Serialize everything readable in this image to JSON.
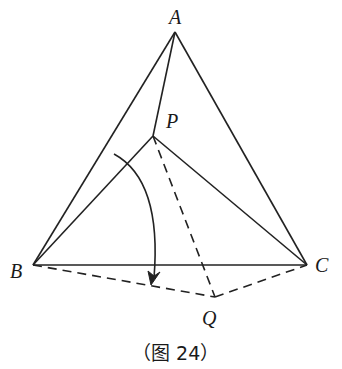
{
  "figure": {
    "caption": "（图 24）",
    "points": {
      "A": {
        "label": "A",
        "x": 175,
        "y": 32
      },
      "P": {
        "label": "P",
        "x": 153,
        "y": 136
      },
      "B": {
        "label": "B",
        "x": 33,
        "y": 265
      },
      "C": {
        "label": "C",
        "x": 307,
        "y": 265
      },
      "Q": {
        "label": "Q",
        "x": 215,
        "y": 297
      }
    },
    "solid_segments": [
      "AB",
      "AC",
      "BC",
      "AP",
      "PB",
      "PC"
    ],
    "dashed_segments": [
      "BQ",
      "QC",
      "PQ"
    ],
    "rotation_arrow": "arc from segment PB toward segment BQ (rotation about B)"
  }
}
